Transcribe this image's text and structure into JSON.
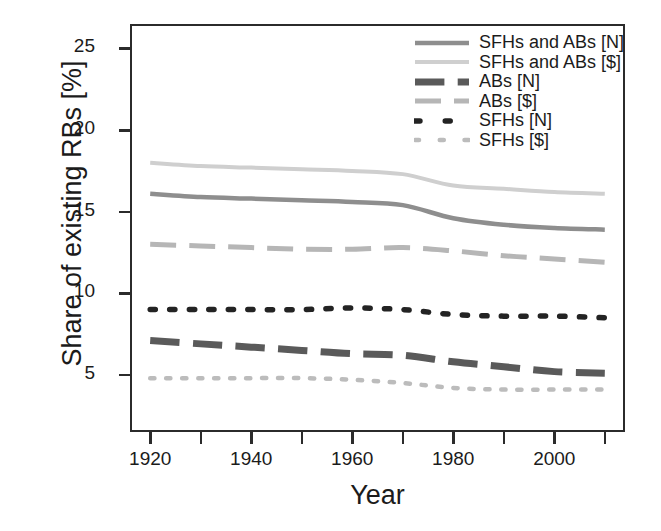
{
  "chart_data": {
    "type": "line",
    "title": "",
    "xlabel": "Year",
    "ylabel": "Share of existing RBs [%]",
    "xlim": [
      1916,
      2014
    ],
    "ylim": [
      1.5,
      26.5
    ],
    "grid": false,
    "legend_position": "top-right",
    "xticks_major": [
      1920,
      1940,
      1960,
      1980,
      2000
    ],
    "xticks_minor": [
      1930,
      1950,
      1970,
      1990,
      2010
    ],
    "yticks": [
      5,
      10,
      15,
      20,
      25
    ],
    "x": [
      1920,
      1930,
      1940,
      1950,
      1960,
      1970,
      1980,
      1990,
      2000,
      2010
    ],
    "series": [
      {
        "name": "SFHs and ABs [N]",
        "style": "solid",
        "color": "#8e8e8e",
        "width": 4.5,
        "values": [
          16.1,
          15.9,
          15.8,
          15.7,
          15.6,
          15.4,
          14.6,
          14.2,
          14.0,
          13.9
        ]
      },
      {
        "name": "SFHs and ABs [$]",
        "style": "solid",
        "color": "#cfcfcf",
        "width": 4.0,
        "values": [
          18.0,
          17.8,
          17.7,
          17.6,
          17.5,
          17.3,
          16.6,
          16.4,
          16.2,
          16.1
        ]
      },
      {
        "name": "ABs [N]",
        "style": "dashed-thick",
        "color": "#5a5a5a",
        "width": 7.0,
        "values": [
          7.1,
          6.9,
          6.7,
          6.5,
          6.3,
          6.2,
          5.8,
          5.5,
          5.2,
          5.1
        ]
      },
      {
        "name": "ABs [$]",
        "style": "dashed",
        "color": "#b6b6b6",
        "width": 5.0,
        "values": [
          13.0,
          12.9,
          12.8,
          12.7,
          12.7,
          12.8,
          12.6,
          12.3,
          12.1,
          11.9
        ]
      },
      {
        "name": "SFHs [N]",
        "style": "dotted",
        "color": "#232323",
        "width": 5.5,
        "values": [
          9.0,
          9.0,
          9.0,
          9.0,
          9.1,
          9.0,
          8.7,
          8.6,
          8.6,
          8.5
        ]
      },
      {
        "name": "SFHs [$]",
        "style": "dotted",
        "color": "#bcbcbc",
        "width": 4.5,
        "values": [
          4.8,
          4.8,
          4.8,
          4.8,
          4.7,
          4.5,
          4.2,
          4.1,
          4.1,
          4.1
        ]
      }
    ]
  },
  "axes": {
    "ylabel": "Share of existing RBs [%]",
    "xlabel": "Year",
    "ytick_labels": [
      "25",
      "20",
      "15",
      "10",
      "5"
    ],
    "ytick_values": [
      25,
      20,
      15,
      10,
      5
    ],
    "xtick_labels": [
      "1920",
      "1940",
      "1960",
      "1980",
      "2000"
    ],
    "xtick_values": [
      1920,
      1940,
      1960,
      1980,
      2000
    ],
    "xtick_minor_values": [
      1930,
      1950,
      1970,
      1990,
      2010
    ]
  },
  "legend": {
    "items": [
      {
        "label": "SFHs and ABs [N]",
        "color": "#8e8e8e",
        "style": "solid",
        "width": 4.5
      },
      {
        "label": "SFHs and ABs [$]",
        "color": "#cfcfcf",
        "style": "solid",
        "width": 4.0
      },
      {
        "label": "ABs [N]",
        "color": "#5a5a5a",
        "style": "dashed-thick",
        "width": 7.0
      },
      {
        "label": "ABs [$]",
        "color": "#b6b6b6",
        "style": "dashed",
        "width": 5.0
      },
      {
        "label": "SFHs [N]",
        "color": "#232323",
        "style": "dotted",
        "width": 5.5
      },
      {
        "label": "SFHs [$]",
        "color": "#bcbcbc",
        "style": "dotted",
        "width": 4.5
      }
    ]
  },
  "colors": {
    "axis": "#2b2b2b",
    "text": "#1b1b1b",
    "background": "#ffffff"
  }
}
